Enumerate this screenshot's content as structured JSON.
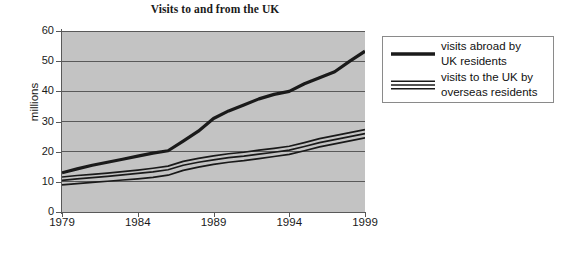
{
  "chart_data": {
    "type": "line",
    "title": "Visits to and from the UK",
    "xlabel": "",
    "ylabel": "millions",
    "x": [
      1979,
      1980,
      1981,
      1982,
      1983,
      1984,
      1985,
      1986,
      1987,
      1988,
      1989,
      1990,
      1991,
      1992,
      1993,
      1994,
      1995,
      1996,
      1997,
      1998,
      1999
    ],
    "xlim": [
      1979,
      1999
    ],
    "ylim": [
      0,
      60
    ],
    "xticks": [
      1979,
      1984,
      1989,
      1994,
      1999
    ],
    "xtick_labels": [
      "1979",
      "1984",
      "1989",
      "1994",
      "1999"
    ],
    "yticks": [
      0,
      10,
      20,
      30,
      40,
      50,
      60
    ],
    "ytick_labels": [
      "0",
      "10",
      "20",
      "30",
      "40",
      "50",
      "60"
    ],
    "grid": true,
    "grid_axis": "y",
    "legend_position": "right-outside",
    "plot_background": "#c3c3c3",
    "line_color": "#1a1a1a",
    "series": [
      {
        "name": "visits abroad by UK residents",
        "style": "single-thick-line",
        "values": [
          13.0,
          14.3,
          15.5,
          16.5,
          17.5,
          18.5,
          19.5,
          20.3,
          23.5,
          26.8,
          31.0,
          33.5,
          35.5,
          37.5,
          39.0,
          40.0,
          42.5,
          44.5,
          46.5,
          50.0,
          53.3
        ]
      },
      {
        "name": "visits to the UK by overseas residents",
        "style": "triple-band-line",
        "values": [
          10.5,
          11.0,
          11.4,
          11.8,
          12.3,
          12.8,
          13.3,
          14.0,
          15.5,
          16.5,
          17.3,
          18.0,
          18.5,
          19.2,
          19.8,
          20.5,
          21.7,
          23.0,
          24.0,
          25.0,
          26.0
        ],
        "band_lower": [
          9.0,
          9.4,
          9.8,
          10.2,
          10.6,
          11.0,
          11.5,
          12.2,
          13.8,
          14.9,
          15.8,
          16.5,
          17.0,
          17.7,
          18.4,
          19.1,
          20.3,
          21.6,
          22.6,
          23.6,
          24.6
        ],
        "band_upper": [
          11.6,
          12.1,
          12.5,
          12.9,
          13.4,
          13.9,
          14.5,
          15.2,
          16.8,
          17.8,
          18.6,
          19.3,
          19.8,
          20.5,
          21.1,
          21.8,
          23.0,
          24.3,
          25.3,
          26.3,
          27.3
        ]
      }
    ]
  },
  "legend": {
    "entries": [
      {
        "line1": "visits abroad by",
        "line2": "UK residents",
        "swatch": "thick-line-swatch"
      },
      {
        "line1": "visits to the UK by",
        "line2": "overseas residents",
        "swatch": "triple-line-swatch"
      }
    ]
  }
}
